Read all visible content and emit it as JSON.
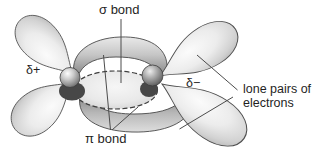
{
  "diagram": {
    "labels": {
      "sigma_bond": "σ bond",
      "pi_bond": "π bond",
      "delta_plus": "δ+",
      "delta_minus": "δ−",
      "lone_pairs": "lone pairs of electrons"
    },
    "colors": {
      "background": "#ffffff",
      "orbital_fill_light": "#ececec",
      "orbital_fill_dark": "#9a9a9a",
      "outline": "#4a4a4a",
      "leader_line": "#4c4c4c",
      "label_text": "#1f1f1f"
    }
  }
}
